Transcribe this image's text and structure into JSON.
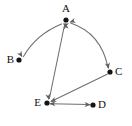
{
  "diagram": {
    "type": "directed-graph",
    "title": "",
    "background_color": "#ffffff",
    "canvas": {
      "width": 132,
      "height": 126
    },
    "style": {
      "edge_color": "#6e6e72",
      "arrow_color": "#5d5d61",
      "node_color": "#141414",
      "label_color": "#111111",
      "node_radius": 2.6,
      "edge_width": 1.05
    },
    "nodes": [
      {
        "id": "A",
        "label": "A",
        "x": 66,
        "y": 20,
        "label_position": "above",
        "label_x": 66,
        "label_y": 9
      },
      {
        "id": "B",
        "label": "B",
        "x": 19,
        "y": 60,
        "label_position": "left",
        "label_x": 14,
        "label_y": 60
      },
      {
        "id": "C",
        "label": "C",
        "x": 110,
        "y": 72,
        "label_position": "right",
        "label_x": 115,
        "label_y": 72
      },
      {
        "id": "D",
        "label": "D",
        "x": 93,
        "y": 105,
        "label_position": "right",
        "label_x": 98,
        "label_y": 105
      },
      {
        "id": "E",
        "label": "E",
        "x": 47,
        "y": 103,
        "label_position": "left",
        "label_x": 41,
        "label_y": 103
      }
    ],
    "edges": [
      {
        "id": "edge-a-b",
        "from": "A",
        "to": "B",
        "shape": "curved",
        "curvature": "bows-down-left",
        "direction": "bidirectional",
        "arrow_at_from": true,
        "arrow_at_to": true,
        "path": "M 61.5 24.0 Q 36.0 34.5 23.5 56.5",
        "arrow_from": {
          "x": 62.6,
          "y": 23.6,
          "angle": -158
        },
        "arrow_to": {
          "x": 22.3,
          "y": 57.3,
          "angle": 60
        }
      },
      {
        "id": "edge-a-c",
        "from": "A",
        "to": "C",
        "shape": "curved",
        "curvature": "bows-right",
        "direction": "bidirectional",
        "arrow_at_from": true,
        "arrow_at_to": true,
        "path": "M 70.6 23.0 Q 101.0 33.0 108.0 67.5",
        "arrow_from": {
          "x": 69.4,
          "y": 22.3,
          "angle": -198
        },
        "arrow_to": {
          "x": 108.6,
          "y": 69.0,
          "angle": 79
        }
      },
      {
        "id": "edge-a-e",
        "from": "A",
        "to": "E",
        "shape": "straight",
        "direction": "bidirectional",
        "arrow_at_from": true,
        "arrow_at_to": true,
        "path": "M 64.6 24.5 L 49.4 98.5",
        "arrow_from": {
          "x": 65.0,
          "y": 23.0,
          "angle": -101.6
        },
        "arrow_to": {
          "x": 49.0,
          "y": 100.0,
          "angle": 78.4
        }
      },
      {
        "id": "edge-c-e",
        "from": "C",
        "to": "E",
        "shape": "straight",
        "direction": "one-way",
        "arrow_at_from": false,
        "arrow_at_to": true,
        "path": "M 107.2 74.2 L 51.5 101.3",
        "arrow_to": {
          "x": 50.2,
          "y": 101.9,
          "angle": 154.1
        }
      },
      {
        "id": "edge-e-d",
        "from": "E",
        "to": "D",
        "shape": "straight",
        "direction": "bidirectional",
        "arrow_at_from": true,
        "arrow_at_to": true,
        "path": "M 50.5 103.8 L 89.5 104.6",
        "arrow_from": {
          "x": 49.2,
          "y": 103.7,
          "angle": 181.2
        },
        "arrow_to": {
          "x": 90.8,
          "y": 104.7,
          "angle": 1.2
        }
      }
    ]
  }
}
